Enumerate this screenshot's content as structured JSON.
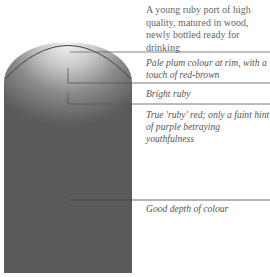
{
  "diagram": {
    "title": "A young ruby port of high quality, matured in wood, newly bottled ready for drinking",
    "colors": {
      "wine_dark": "#5a5a5a",
      "wine_rim": "#f4f4f4",
      "line": "#555555",
      "text": "#555555"
    },
    "annotations": [
      {
        "id": "rim",
        "text": "Pale plum colour at rim, with a touch of red-brown"
      },
      {
        "id": "bright",
        "text": "Bright ruby"
      },
      {
        "id": "true-ruby",
        "text": "True 'ruby' red; only a faint hint of purple betraying youthfulness"
      },
      {
        "id": "depth",
        "text": "Good depth of colour"
      }
    ]
  }
}
